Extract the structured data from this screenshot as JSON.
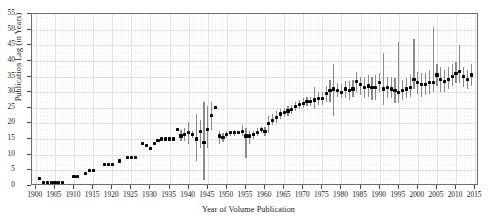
{
  "chart_data": {
    "type": "scatter",
    "title": "",
    "xlabel": "Year of Volume Publication",
    "ylabel": "Publication Lag (in Years)",
    "xlim": [
      1899,
      2016
    ],
    "ylim": [
      0,
      55
    ],
    "xticks": [
      1900,
      1905,
      1910,
      1915,
      1920,
      1925,
      1930,
      1935,
      1940,
      1945,
      1950,
      1955,
      1960,
      1965,
      1970,
      1975,
      1980,
      1985,
      1990,
      1995,
      2000,
      2005,
      2010,
      2015
    ],
    "yticks": [
      0,
      5,
      10,
      15,
      20,
      25,
      30,
      35,
      40,
      45,
      50,
      55
    ],
    "xtick_labels": [
      "1900",
      "1905",
      "1910",
      "1915",
      "1920",
      "1925",
      "1930",
      "1935",
      "1940",
      "1945",
      "1950",
      "1955",
      "1960",
      "1965",
      "1970",
      "1975",
      "1980",
      "1985",
      "1990",
      "1995",
      "2000",
      "2005",
      "2010",
      "2015"
    ],
    "ytick_labels": [
      "0",
      "5",
      "10",
      "15",
      "20",
      "25",
      "30",
      "35",
      "40",
      "45",
      "50",
      "55"
    ],
    "grid": true,
    "legend": null,
    "marker_color": "#000000",
    "errorbar_color": "#8a8a8a",
    "grid_color": "#e2e2e2",
    "axis_color": "#6e6e6e",
    "series": [
      {
        "name": "Publication lag",
        "x": [
          1901,
          1902,
          1903,
          1904,
          1905,
          1906,
          1907,
          1910,
          1911,
          1913,
          1914,
          1915,
          1918,
          1919,
          1920,
          1922,
          1924,
          1925,
          1926,
          1928,
          1929,
          1930,
          1931,
          1932,
          1933,
          1934,
          1935,
          1936,
          1937,
          1938,
          1939,
          1940,
          1941,
          1942,
          1943,
          1944,
          1945,
          1946,
          1947,
          1948,
          1949,
          1950,
          1951,
          1952,
          1953,
          1954,
          1955,
          1956,
          1957,
          1958,
          1959,
          1960,
          1961,
          1962,
          1963,
          1964,
          1965,
          1966,
          1967,
          1968,
          1969,
          1970,
          1971,
          1972,
          1973,
          1974,
          1975,
          1976,
          1977,
          1978,
          1979,
          1980,
          1981,
          1982,
          1983,
          1984,
          1985,
          1986,
          1987,
          1988,
          1989,
          1990,
          1991,
          1992,
          1993,
          1994,
          1995,
          1996,
          1997,
          1998,
          1999,
          2000,
          2001,
          2002,
          2003,
          2004,
          2005,
          2006,
          2007,
          2008,
          2009,
          2010,
          2011,
          2012,
          2013,
          2014
        ],
        "y": [
          2.5,
          1.0,
          1.0,
          1.0,
          1.0,
          1.0,
          1.0,
          3.0,
          3.0,
          4.0,
          5.0,
          5.0,
          7.0,
          7.0,
          7.0,
          8.0,
          9.0,
          9.0,
          9.0,
          13.5,
          13.0,
          12.0,
          13.5,
          14.5,
          15.0,
          15.0,
          15.0,
          15.0,
          18.0,
          16.0,
          16.5,
          17.0,
          16.5,
          15.0,
          17.5,
          14.0,
          18.0,
          22.5,
          25.0,
          16.0,
          15.5,
          16.5,
          17.0,
          17.0,
          17.0,
          17.5,
          16.0,
          16.0,
          16.5,
          17.0,
          18.0,
          17.5,
          20.0,
          21.0,
          22.0,
          23.0,
          23.5,
          24.0,
          24.5,
          25.5,
          26.0,
          26.5,
          27.0,
          27.0,
          27.5,
          28.0,
          28.0,
          29.5,
          30.5,
          31.0,
          30.5,
          30.0,
          31.0,
          30.5,
          31.0,
          33.5,
          32.5,
          31.5,
          32.0,
          31.5,
          31.5,
          33.0,
          31.0,
          31.5,
          31.0,
          30.5,
          30.0,
          30.5,
          31.0,
          31.5,
          34.0,
          33.0,
          32.5,
          32.5,
          33.0,
          33.0,
          35.5,
          34.0,
          33.5,
          34.0,
          35.0,
          36.0,
          36.5,
          35.0,
          34.0,
          35.5
        ],
        "ylow": [
          2.5,
          1.0,
          1.0,
          1.0,
          1.0,
          1.0,
          1.0,
          3.0,
          3.0,
          4.0,
          5.0,
          5.0,
          7.0,
          7.0,
          7.0,
          8.0,
          9.0,
          9.0,
          9.0,
          13.5,
          13.0,
          12.0,
          13.5,
          14.5,
          15.0,
          15.0,
          15.0,
          15.0,
          18.0,
          14.5,
          14.5,
          13.5,
          15.5,
          8.0,
          12.0,
          2.0,
          12.0,
          18.0,
          25.0,
          13.5,
          14.0,
          15.5,
          16.0,
          16.0,
          16.5,
          16.0,
          9.0,
          13.5,
          15.0,
          16.0,
          17.0,
          16.0,
          17.0,
          19.5,
          20.0,
          21.5,
          22.0,
          22.5,
          23.0,
          24.0,
          24.5,
          25.0,
          25.5,
          25.5,
          24.5,
          26.0,
          26.0,
          27.0,
          27.0,
          22.5,
          28.5,
          28.0,
          28.0,
          27.5,
          28.5,
          30.0,
          29.0,
          28.0,
          28.5,
          27.5,
          27.5,
          30.0,
          26.0,
          28.0,
          28.0,
          26.5,
          26.5,
          27.5,
          28.0,
          28.5,
          31.0,
          29.5,
          28.5,
          29.0,
          29.5,
          30.0,
          32.0,
          30.0,
          30.0,
          31.0,
          32.0,
          33.0,
          33.0,
          31.5,
          31.0,
          32.0
        ],
        "yhigh": [
          2.5,
          1.0,
          1.0,
          1.0,
          1.0,
          1.0,
          1.0,
          3.0,
          3.0,
          4.0,
          5.0,
          5.0,
          7.0,
          7.0,
          7.0,
          8.0,
          9.0,
          9.0,
          9.0,
          13.5,
          13.0,
          12.0,
          13.5,
          14.5,
          15.0,
          15.0,
          15.0,
          15.0,
          18.0,
          18.0,
          18.5,
          20.5,
          17.5,
          23.0,
          21.0,
          27.0,
          25.5,
          27.0,
          25.0,
          17.5,
          17.0,
          17.5,
          17.5,
          18.0,
          17.5,
          19.5,
          18.5,
          17.5,
          17.5,
          18.5,
          19.0,
          19.0,
          22.5,
          23.0,
          24.0,
          24.5,
          25.0,
          25.5,
          26.0,
          27.0,
          27.5,
          28.0,
          28.5,
          28.5,
          31.5,
          30.0,
          30.0,
          32.0,
          34.0,
          39.0,
          33.0,
          32.5,
          33.5,
          33.5,
          34.0,
          36.5,
          35.0,
          34.5,
          35.5,
          35.0,
          35.5,
          36.0,
          42.5,
          35.0,
          35.0,
          34.5,
          46.0,
          34.0,
          34.5,
          35.5,
          47.0,
          36.5,
          36.0,
          36.0,
          37.0,
          51.0,
          39.0,
          38.0,
          37.0,
          38.0,
          39.0,
          39.5,
          45.0,
          38.0,
          37.0,
          39.0
        ]
      }
    ]
  }
}
